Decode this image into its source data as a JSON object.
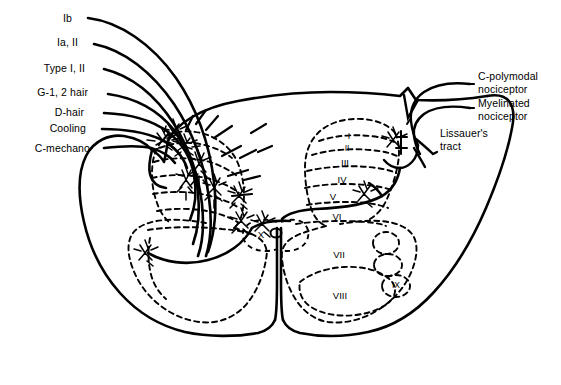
{
  "figure": {
    "type": "anatomical-diagram",
    "background_color": "#ffffff",
    "line_color": "#000000"
  },
  "left_labels": [
    {
      "id": "ib",
      "text": "Ib",
      "x": 72,
      "y": 18
    },
    {
      "id": "ia-ii",
      "text": "Ia, II",
      "x": 78,
      "y": 42
    },
    {
      "id": "type-i-ii",
      "text": "Type I, II",
      "x": 85,
      "y": 68
    },
    {
      "id": "g12-hair",
      "text": "G-1, 2 hair",
      "x": 88,
      "y": 92
    },
    {
      "id": "d-hair",
      "text": "D-hair",
      "x": 84,
      "y": 112
    },
    {
      "id": "cooling",
      "text": "Cooling",
      "x": 86,
      "y": 128
    },
    {
      "id": "c-mechano",
      "text": "C-mechano",
      "x": 90,
      "y": 148
    }
  ],
  "right_labels": [
    {
      "id": "c-polymodal-nociceptor",
      "line1": "C-polymodal",
      "line2": "nociceptor",
      "x": 478,
      "y": 83
    },
    {
      "id": "myelinated-nociceptor",
      "line1": "Myelinated",
      "line2": "nociceptor",
      "x": 478,
      "y": 110
    },
    {
      "id": "lissauers-tract",
      "line1": "Lissauer's",
      "line2": "tract",
      "x": 440,
      "y": 140
    }
  ],
  "laminae": [
    {
      "id": "lamina-1",
      "text": "I",
      "x": 349,
      "y": 136
    },
    {
      "id": "lamina-2",
      "text": "II",
      "x": 347,
      "y": 148
    },
    {
      "id": "lamina-3",
      "text": "III",
      "x": 345,
      "y": 162
    },
    {
      "id": "lamina-4",
      "text": "IV",
      "x": 342,
      "y": 179
    },
    {
      "id": "lamina-5",
      "text": "V",
      "x": 333,
      "y": 196
    },
    {
      "id": "lamina-6",
      "text": "VI",
      "x": 337,
      "y": 216
    },
    {
      "id": "lamina-7",
      "text": "VII",
      "x": 339,
      "y": 254
    },
    {
      "id": "lamina-8",
      "text": "VIII",
      "x": 340,
      "y": 295
    },
    {
      "id": "lamina-9",
      "text": "IX",
      "x": 396,
      "y": 285
    },
    {
      "id": "lamina-10",
      "text": "X",
      "x": 261,
      "y": 234
    }
  ]
}
